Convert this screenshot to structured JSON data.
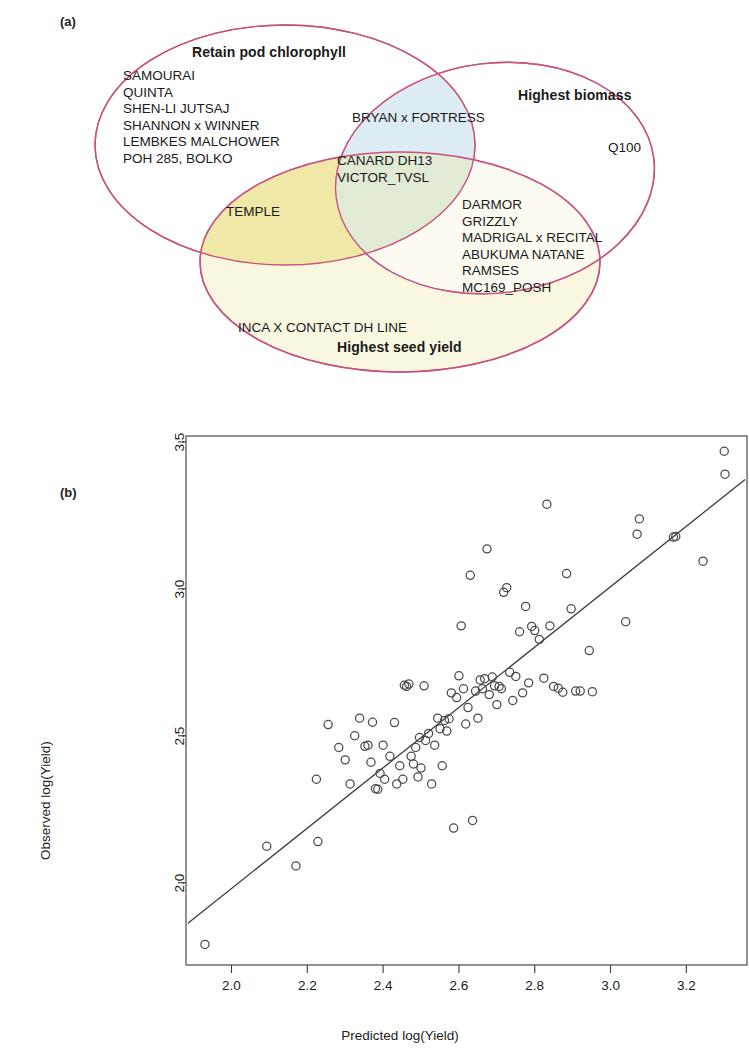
{
  "figure": {
    "panel_a_label": "(a)",
    "panel_b_label": "(b)"
  },
  "venn": {
    "stroke_color": "#c8537f",
    "sets": [
      {
        "id": "chlorophyll",
        "title": "Retain pod chlorophyll",
        "fill": "#ffffff"
      },
      {
        "id": "biomass",
        "title": "Highest biomass",
        "fill": "#dce9f2"
      },
      {
        "id": "yield",
        "title": "Highest seed yield",
        "fill": "#f7f4d8"
      }
    ],
    "regions": {
      "chlorophyll_only": [
        "SAMOURAI",
        "QUINTA",
        "SHEN-LI JUTSAJ",
        "SHANNON x WINNER",
        "LEMBKES MALCHOWER",
        "POH 285, BOLKO"
      ],
      "chlorophyll_biomass": [
        "BRYAN x FORTRESS"
      ],
      "chlorophyll_yield": [
        "TEMPLE"
      ],
      "all_three": [
        "CANARD DH13",
        "VICTOR_TVSL"
      ],
      "biomass_yield": [
        "DARMOR",
        "GRIZZLY",
        "MADRIGAL x RECITAL",
        "ABUKUMA NATANE",
        "RAMSES",
        "MC169_POSH"
      ],
      "biomass_only": [
        "Q100"
      ],
      "yield_only": [
        "INCA X CONTACT DH LINE"
      ]
    },
    "overlap_colors": {
      "chlorophyll_biomass": "#dce9f2",
      "chlorophyll_yield": "#efe7a6",
      "biomass_yield": "#ffffff",
      "all_three": "#e3ecd9"
    }
  },
  "chart_data": {
    "type": "scatter",
    "title": "",
    "xlabel": "Predicted log(Yield)",
    "ylabel": "Observed log(Yield)",
    "xlim": [
      1.88,
      3.36
    ],
    "ylim": [
      1.72,
      3.52
    ],
    "xticks": [
      2.0,
      2.2,
      2.4,
      2.6,
      2.8,
      3.0,
      3.2
    ],
    "yticks": [
      2.0,
      2.5,
      3.0,
      3.5
    ],
    "xticklabels": [
      "2.0",
      "2.2",
      "2.4",
      "2.6",
      "2.8",
      "3.0",
      "3.2"
    ],
    "yticklabels": [
      "2.0",
      "2.5",
      "3.0",
      "3.5"
    ],
    "grid": false,
    "legend": null,
    "marker": "open-circle",
    "marker_color": "#4a4a4a",
    "fit_line": {
      "label": "regression line",
      "color": "#3a3a3a",
      "x": [
        1.885,
        3.355
      ],
      "y": [
        1.862,
        3.372
      ]
    },
    "points": [
      [
        1.93,
        1.79
      ],
      [
        2.093,
        2.124
      ],
      [
        2.17,
        2.057
      ],
      [
        2.228,
        2.14
      ],
      [
        2.224,
        2.352
      ],
      [
        2.255,
        2.538
      ],
      [
        2.283,
        2.46
      ],
      [
        2.3,
        2.418
      ],
      [
        2.313,
        2.336
      ],
      [
        2.325,
        2.5
      ],
      [
        2.338,
        2.56
      ],
      [
        2.352,
        2.464
      ],
      [
        2.36,
        2.468
      ],
      [
        2.368,
        2.41
      ],
      [
        2.372,
        2.546
      ],
      [
        2.38,
        2.32
      ],
      [
        2.386,
        2.318
      ],
      [
        2.392,
        2.372
      ],
      [
        2.4,
        2.468
      ],
      [
        2.404,
        2.352
      ],
      [
        2.418,
        2.43
      ],
      [
        2.43,
        2.545
      ],
      [
        2.436,
        2.336
      ],
      [
        2.444,
        2.398
      ],
      [
        2.452,
        2.352
      ],
      [
        2.456,
        2.672
      ],
      [
        2.462,
        2.668
      ],
      [
        2.468,
        2.676
      ],
      [
        2.474,
        2.43
      ],
      [
        2.48,
        2.404
      ],
      [
        2.486,
        2.46
      ],
      [
        2.492,
        2.36
      ],
      [
        2.496,
        2.494
      ],
      [
        2.5,
        2.39
      ],
      [
        2.508,
        2.67
      ],
      [
        2.512,
        2.484
      ],
      [
        2.52,
        2.508
      ],
      [
        2.528,
        2.336
      ],
      [
        2.536,
        2.468
      ],
      [
        2.544,
        2.56
      ],
      [
        2.55,
        2.524
      ],
      [
        2.556,
        2.398
      ],
      [
        2.562,
        2.552
      ],
      [
        2.568,
        2.516
      ],
      [
        2.574,
        2.558
      ],
      [
        2.58,
        2.646
      ],
      [
        2.586,
        2.186
      ],
      [
        2.594,
        2.63
      ],
      [
        2.6,
        2.704
      ],
      [
        2.606,
        2.874
      ],
      [
        2.612,
        2.66
      ],
      [
        2.618,
        2.54
      ],
      [
        2.624,
        2.596
      ],
      [
        2.63,
        3.046
      ],
      [
        2.636,
        2.212
      ],
      [
        2.644,
        2.652
      ],
      [
        2.65,
        2.56
      ],
      [
        2.656,
        2.69
      ],
      [
        2.662,
        2.66
      ],
      [
        2.668,
        2.694
      ],
      [
        2.674,
        3.136
      ],
      [
        2.68,
        2.64
      ],
      [
        2.688,
        2.7
      ],
      [
        2.694,
        2.67
      ],
      [
        2.7,
        2.606
      ],
      [
        2.706,
        2.668
      ],
      [
        2.712,
        2.66
      ],
      [
        2.718,
        2.988
      ],
      [
        2.726,
        3.004
      ],
      [
        2.734,
        2.716
      ],
      [
        2.742,
        2.62
      ],
      [
        2.75,
        2.702
      ],
      [
        2.76,
        2.854
      ],
      [
        2.768,
        2.646
      ],
      [
        2.776,
        2.94
      ],
      [
        2.784,
        2.68
      ],
      [
        2.792,
        2.872
      ],
      [
        2.8,
        2.858
      ],
      [
        2.812,
        2.828
      ],
      [
        2.824,
        2.696
      ],
      [
        2.832,
        3.288
      ],
      [
        2.84,
        2.874
      ],
      [
        2.85,
        2.668
      ],
      [
        2.862,
        2.662
      ],
      [
        2.874,
        2.648
      ],
      [
        2.884,
        3.052
      ],
      [
        2.896,
        2.932
      ],
      [
        2.908,
        2.652
      ],
      [
        2.92,
        2.652
      ],
      [
        2.944,
        2.79
      ],
      [
        2.952,
        2.65
      ],
      [
        3.04,
        2.888
      ],
      [
        3.07,
        3.186
      ],
      [
        3.076,
        3.238
      ],
      [
        3.166,
        3.176
      ],
      [
        3.172,
        3.178
      ],
      [
        3.244,
        3.094
      ],
      [
        3.3,
        3.468
      ],
      [
        3.302,
        3.39
      ]
    ]
  }
}
